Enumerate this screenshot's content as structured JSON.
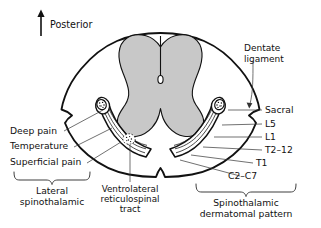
{
  "figure": {
    "orientation": {
      "label": "Posterior",
      "icon": "up-arrow-icon"
    },
    "colors": {
      "gray_matter": "#c8c8c8",
      "outline": "#111111",
      "leader_line": "#333333",
      "background": "#ffffff",
      "text": "#111111"
    },
    "callouts": {
      "dentate_ligament": {
        "line1": "Dentate",
        "line2": "ligament"
      },
      "deep_pain": "Deep pain",
      "temperature": "Temperature",
      "superficial_pain": "Superficial pain",
      "lateral_spinothalamic": {
        "line1": "Lateral",
        "line2": "spinothalamic"
      },
      "ventrolateral_tract": {
        "line1": "Ventrolateral",
        "line2": "reticulospinal",
        "line3": "tract"
      },
      "spinothalamic_dermatomal": {
        "line1": "Spinothalamic",
        "line2": "dermatomal pattern"
      }
    },
    "dermatome_levels": [
      {
        "label": "Sacral"
      },
      {
        "label": "L5"
      },
      {
        "label": "L1"
      },
      {
        "label": "T2–12"
      },
      {
        "label": "T1"
      },
      {
        "label": "C2–C7"
      }
    ]
  }
}
